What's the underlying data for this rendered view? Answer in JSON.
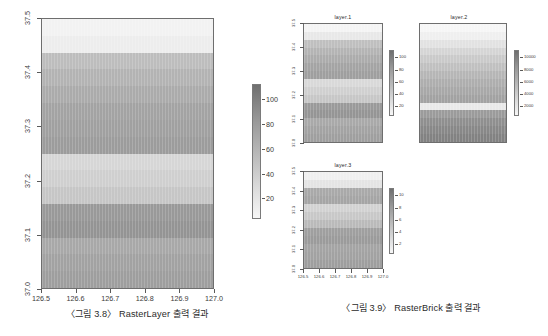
{
  "figure_left": {
    "caption": "〈그림 3.8〉 RasterLayer 출력 결과",
    "x_ticks": [
      "126.5",
      "126.6",
      "126.7",
      "126.8",
      "126.9",
      "127.0"
    ],
    "y_ticks": [
      "37.0",
      "37.1",
      "37.2",
      "37.3",
      "37.4",
      "37.5"
    ],
    "legend_ticks": [
      "100",
      "80",
      "60",
      "40",
      "20"
    ]
  },
  "figure_right": {
    "caption": "〈그림 3.9〉 RasterBrick 출력 결과",
    "panels": [
      {
        "title": "layer.1",
        "legend_ticks": [
          "100",
          "80",
          "60",
          "40",
          "20"
        ],
        "y_ticks": [
          "37.0",
          "37.1",
          "37.2",
          "37.3",
          "37.4",
          "37.5"
        ],
        "x_ticks": []
      },
      {
        "title": "layer.2",
        "legend_ticks": [
          "10000",
          "8000",
          "6000",
          "4000",
          "2000"
        ],
        "y_ticks": [],
        "x_ticks": []
      },
      {
        "title": "layer.3",
        "legend_ticks": [
          "10",
          "8",
          "6",
          "4",
          "2"
        ],
        "y_ticks": [
          "37.0",
          "37.1",
          "37.2",
          "37.3",
          "37.4",
          "37.5"
        ],
        "x_ticks": [
          "126.5",
          "126.6",
          "126.7",
          "126.8",
          "126.9",
          "127.0"
        ]
      }
    ]
  },
  "chart_data": {
    "type": "heatmap",
    "xlabel": "longitude",
    "ylabel": "latitude",
    "xlim": [
      126.5,
      127.0
    ],
    "ylim": [
      37.0,
      37.5
    ],
    "grid": false,
    "colormap": "grayscale (dark = high, light = low)",
    "maps": [
      {
        "name": "RasterLayer",
        "zlim": [
          0,
          100
        ],
        "legend_ticks": [
          100,
          80,
          60,
          40,
          20
        ],
        "row_values_top_to_bottom": [
          96,
          92,
          70,
          62,
          58,
          50,
          48,
          44,
          82,
          78,
          74,
          40,
          36,
          60,
          56,
          52
        ],
        "row_colors_top_to_bottom": [
          "#f2f2f2",
          "#ededed",
          "#bdbdbd",
          "#b3b3b3",
          "#ababab",
          "#a3a3a3",
          "#a0a0a0",
          "#9c9c9c",
          "#d6d6d6",
          "#cfcfcf",
          "#c6c6c6",
          "#999999",
          "#949494",
          "#a8a8a8",
          "#a2a2a2",
          "#9e9e9e"
        ]
      },
      {
        "name": "layer.1",
        "zlim": [
          0,
          100
        ],
        "legend_ticks": [
          100,
          80,
          60,
          40,
          20
        ],
        "row_values_top_to_bottom": [
          96,
          90,
          70,
          62,
          56,
          50,
          46,
          84,
          78,
          72,
          40,
          36,
          60,
          54,
          50
        ],
        "row_colors_top_to_bottom": [
          "#f4f4f4",
          "#e8e8e8",
          "#bfbfbf",
          "#b4b4b4",
          "#acacac",
          "#a4a4a4",
          "#9f9f9f",
          "#d9d9d9",
          "#d0d0d0",
          "#c7c7c7",
          "#9a9a9a",
          "#959595",
          "#a9a9a9",
          "#a3a3a3",
          "#9f9f9f"
        ]
      },
      {
        "name": "layer.2",
        "zlim": [
          0,
          10000
        ],
        "legend_ticks": [
          10000,
          8000,
          6000,
          4000,
          2000
        ],
        "row_values_top_to_bottom": [
          9600,
          9200,
          8400,
          7600,
          7000,
          6400,
          5800,
          5200,
          4800,
          4400,
          8800,
          4000,
          3200,
          2600,
          2000
        ],
        "row_colors_top_to_bottom": [
          "#f6f6f6",
          "#efefef",
          "#e2e2e2",
          "#d5d5d5",
          "#cacaca",
          "#c0c0c0",
          "#b6b6b6",
          "#aeaeae",
          "#a8a8a8",
          "#a2a2a2",
          "#e9e9e9",
          "#9b9b9b",
          "#8f8f8f",
          "#888888",
          "#828282"
        ]
      },
      {
        "name": "layer.3",
        "zlim": [
          0,
          10
        ],
        "legend_ticks": [
          10,
          8,
          6,
          4,
          2
        ],
        "row_values_top_to_bottom": [
          9.6,
          9.0,
          5.6,
          5.2,
          7.8,
          7.2,
          6.4,
          4.6,
          4.2,
          5.0,
          4.8,
          4.4
        ],
        "row_colors_top_to_bottom": [
          "#f0f0f0",
          "#e4e4e4",
          "#a9a9a9",
          "#a5a5a5",
          "#d2d2d2",
          "#c8c8c8",
          "#bababa",
          "#9f9f9f",
          "#9b9b9b",
          "#a4a4a4",
          "#a2a2a2",
          "#9e9e9e"
        ]
      }
    ]
  }
}
